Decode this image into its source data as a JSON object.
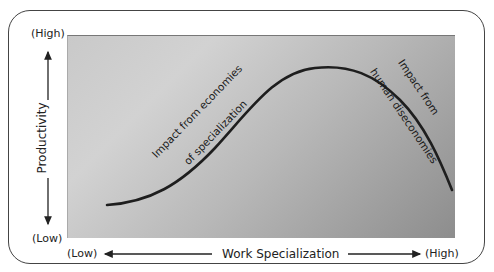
{
  "y_axis": {
    "label": "Productivity",
    "high_label": "(High)",
    "low_label": "(Low)"
  },
  "x_axis": {
    "label": "Work Specialization",
    "low_label": "(Low)",
    "high_label": "(High)"
  },
  "annotations": {
    "rising": [
      "Impact from economies",
      "of specialization"
    ],
    "falling": [
      "Impact from",
      "human diseconomies"
    ]
  },
  "curve": {
    "description": "Productivity rises with specialization, peaks, then declines",
    "points": [
      [
        0.1,
        0.16
      ],
      [
        0.35,
        0.43
      ],
      [
        0.6,
        0.84
      ],
      [
        0.7,
        0.82
      ],
      [
        0.98,
        0.25
      ]
    ]
  },
  "colors": {
    "curve": "#1e1e1e",
    "frame": "#444444",
    "plot_light": "#d2d2d2",
    "plot_dark": "#8d8d8d"
  }
}
